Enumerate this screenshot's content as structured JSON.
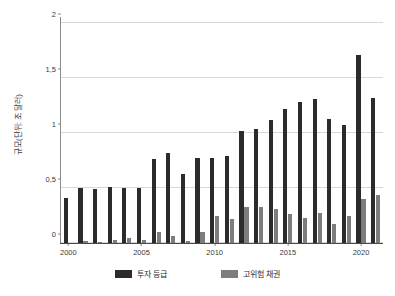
{
  "chart_data": {
    "type": "bar",
    "title": "",
    "subtitle": "",
    "xlabel": "",
    "ylabel": "규모(단위: 조 달러)",
    "ylim": [
      0,
      2
    ],
    "yticks": [
      0,
      0.5,
      1,
      1.5,
      2
    ],
    "ytick_labels": [
      "0",
      "0,5",
      "1",
      "1,5",
      "2"
    ],
    "grid": true,
    "legend_position": "bottom",
    "categories": [
      "2000",
      "2001",
      "2002",
      "2003",
      "2004",
      "2005",
      "2006",
      "2007",
      "2008",
      "2009",
      "2010",
      "2011",
      "2012",
      "2013",
      "2014",
      "2015",
      "2016",
      "2017",
      "2018",
      "2019",
      "2020",
      "2021"
    ],
    "xtick_labels": [
      "2000",
      "2005",
      "2010",
      "2015",
      "2020"
    ],
    "xtick_categories": [
      "2000",
      "2005",
      "2010",
      "2015",
      "2020"
    ],
    "series": [
      {
        "name": "투자 등급",
        "color": "#2b2b2b",
        "values": [
          0.41,
          0.5,
          0.49,
          0.51,
          0.5,
          0.5,
          0.76,
          0.82,
          0.63,
          0.77,
          0.77,
          0.79,
          1.02,
          1.04,
          1.12,
          1.22,
          1.28,
          1.31,
          1.13,
          1.07,
          1.71,
          1.32
        ]
      },
      {
        "name": "고위험 채권",
        "color": "#7d7d7d",
        "values": [
          0.0,
          0.02,
          0.01,
          0.03,
          0.05,
          0.03,
          0.1,
          0.06,
          0.02,
          0.1,
          0.25,
          0.22,
          0.33,
          0.33,
          0.31,
          0.26,
          0.23,
          0.27,
          0.17,
          0.25,
          0.4,
          0.44
        ]
      }
    ]
  },
  "legend": {
    "items": [
      {
        "label": "투자 등급",
        "color": "#2b2b2b"
      },
      {
        "label": "고위험 채권",
        "color": "#7d7d7d"
      }
    ]
  },
  "colors": {
    "background": "#ffffff",
    "gridline": "#d8d8d8",
    "axis": "#4a4a4a",
    "text": "#2b2b2b",
    "series_investment_grade": "#2b2b2b",
    "series_high_yield": "#7d7d7d"
  }
}
